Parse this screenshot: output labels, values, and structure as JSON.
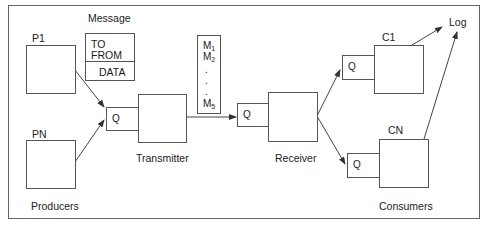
{
  "diagram": {
    "type": "message-queue architecture",
    "producers": {
      "section_label": "Producers",
      "nodes": [
        {
          "id": "P1",
          "label": "P1"
        },
        {
          "id": "PN",
          "label": "PN"
        }
      ]
    },
    "message": {
      "title": "Message",
      "fields": [
        "TO",
        "FROM",
        "DATA"
      ]
    },
    "transmitter": {
      "label": "Transmitter",
      "queue_label": "Q"
    },
    "message_list": {
      "items": [
        {
          "base": "M",
          "sub": "1"
        },
        {
          "base": "M",
          "sub": "2"
        },
        {
          "base": ".",
          "sub": ""
        },
        {
          "base": ".",
          "sub": ""
        },
        {
          "base": ".",
          "sub": ""
        },
        {
          "base": "M",
          "sub": "5"
        }
      ]
    },
    "receiver": {
      "label": "Receiver",
      "queue_label": "Q"
    },
    "consumers": {
      "section_label": "Consumers",
      "nodes": [
        {
          "id": "C1",
          "label": "C1",
          "queue_label": "Q"
        },
        {
          "id": "CN",
          "label": "CN",
          "queue_label": "Q"
        }
      ]
    },
    "log": {
      "label": "Log"
    },
    "edges": [
      {
        "from": "P1",
        "to": "Transmitter.Q"
      },
      {
        "from": "PN",
        "to": "Transmitter.Q"
      },
      {
        "from": "Transmitter",
        "to": "Receiver.Q"
      },
      {
        "from": "Receiver",
        "to": "C1.Q"
      },
      {
        "from": "Receiver",
        "to": "CN.Q"
      },
      {
        "from": "C1",
        "to": "Log"
      },
      {
        "from": "CN",
        "to": "Log"
      }
    ],
    "colors": {
      "stroke": "#555555",
      "text": "#222222",
      "background": "#ffffff"
    }
  }
}
